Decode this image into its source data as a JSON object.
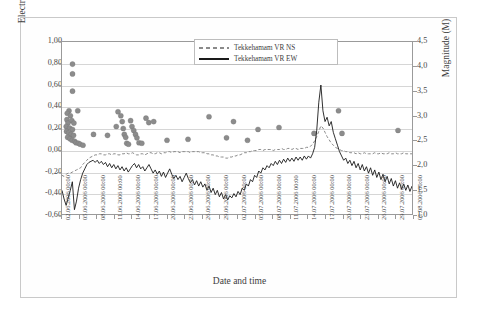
{
  "chart_data": {
    "type": "line",
    "title": "",
    "xlabel": "Date and time",
    "ylabel": "Electric potential (mV)",
    "y2label": "Magnitude (M)",
    "ylim": [
      -0.6,
      1.0
    ],
    "y2lim": [
      1.0,
      4.5
    ],
    "grid": true,
    "legend_position": "top-center",
    "y_ticks": [
      "-0,60",
      "-0,40",
      "-0,20",
      "0,00",
      "0,20",
      "0,40",
      "0,60",
      "0,80",
      "1,00"
    ],
    "y2_ticks": [
      "1,0",
      "1,5",
      "2,0",
      "2,5",
      "3,0",
      "3,5",
      "4,0",
      "4,5"
    ],
    "x_ticks": [
      "02.06.2006 00:00",
      "05.06.2006 00:00",
      "08.06.2006 00:00",
      "11.06.2006 00:00",
      "14.06.2006 00:00",
      "17.06.2006 00:00",
      "20.06.2006 00:00",
      "23.06.2006 00:00",
      "26.06.2006 00:00",
      "29.06.2006 00:00",
      "02.07.2006 00:00",
      "05.07.2006 00:00",
      "08.07.2006 00:00",
      "11.07.2006 00:00",
      "14.07.2006 00:00",
      "17.07.2006 00:00",
      "20.07.2006 00:00",
      "23.07.2006 00:00",
      "26.07.2006 00:00",
      "29.07.2006 00:00",
      "01.08.2006 00:00"
    ],
    "series": [
      {
        "name": "Tekkehamam VR NS",
        "style": "dashed",
        "color": "#8a8a8a",
        "axis": "left",
        "values": [
          -0.24,
          -0.25,
          -0.23,
          -0.22,
          -0.22,
          -0.21,
          -0.2,
          -0.19,
          -0.18,
          -0.17,
          -0.14,
          -0.12,
          -0.1,
          -0.08,
          -0.07,
          -0.06,
          -0.05,
          -0.05,
          -0.04,
          -0.04,
          -0.05,
          -0.05,
          -0.04,
          -0.04,
          -0.05,
          -0.04,
          -0.04,
          -0.05,
          -0.05,
          -0.04,
          -0.04,
          -0.03,
          -0.04,
          -0.04,
          -0.03,
          -0.04,
          -0.05,
          -0.05,
          -0.04,
          -0.04,
          -0.05,
          -0.04,
          -0.03,
          -0.03,
          -0.04,
          -0.04,
          -0.03,
          -0.03,
          -0.04,
          -0.03,
          -0.03,
          -0.02,
          -0.02,
          -0.03,
          -0.02,
          -0.02,
          -0.02,
          -0.03,
          -0.02,
          -0.02,
          -0.02,
          -0.02,
          -0.03,
          -0.02,
          -0.02,
          -0.02,
          -0.02,
          -0.03,
          -0.03,
          -0.03,
          -0.04,
          -0.04,
          -0.05,
          -0.05,
          -0.06,
          -0.06,
          -0.07,
          -0.07,
          -0.07,
          -0.08,
          -0.08,
          -0.07,
          -0.07,
          -0.06,
          -0.06,
          -0.05,
          -0.05,
          -0.04,
          -0.03,
          -0.03,
          -0.02,
          -0.02,
          -0.01,
          -0.01,
          -0.01,
          0.0,
          0.0,
          -0.01,
          0.0,
          0.0,
          0.0,
          0.0,
          -0.01,
          0.0,
          0.0,
          0.0,
          0.01,
          0.0,
          0.0,
          0.01,
          0.01,
          0.0,
          0.01,
          0.01,
          0.0,
          0.01,
          0.01,
          0.01,
          0.02,
          0.02,
          0.03,
          0.05,
          0.08,
          0.12,
          0.17,
          0.22,
          0.2,
          0.16,
          0.12,
          0.09,
          0.06,
          0.04,
          0.02,
          0.01,
          0.0,
          -0.01,
          -0.01,
          -0.02,
          -0.02,
          -0.03,
          -0.03,
          -0.03,
          -0.04,
          -0.03,
          -0.04,
          -0.04,
          -0.03,
          -0.04,
          -0.04,
          -0.04,
          -0.04,
          -0.03,
          -0.04,
          -0.04,
          -0.03,
          -0.04,
          -0.04,
          -0.04,
          -0.03,
          -0.04,
          -0.04,
          -0.03,
          -0.04,
          -0.04,
          -0.04,
          -0.03,
          -0.04,
          -0.04,
          -0.04,
          -0.04
        ]
      },
      {
        "name": "Tekkehamam VR EW",
        "style": "solid",
        "color": "#1a1a1a",
        "axis": "left",
        "values": [
          -0.38,
          -0.46,
          -0.52,
          -0.45,
          -0.38,
          -0.3,
          -0.56,
          -0.48,
          -0.36,
          -0.28,
          -0.22,
          -0.18,
          -0.14,
          -0.12,
          -0.11,
          -0.1,
          -0.12,
          -0.1,
          -0.13,
          -0.11,
          -0.14,
          -0.12,
          -0.16,
          -0.13,
          -0.17,
          -0.14,
          -0.18,
          -0.15,
          -0.19,
          -0.16,
          -0.2,
          -0.17,
          -0.21,
          -0.18,
          -0.15,
          -0.13,
          -0.17,
          -0.14,
          -0.18,
          -0.16,
          -0.2,
          -0.17,
          -0.14,
          -0.18,
          -0.22,
          -0.19,
          -0.23,
          -0.2,
          -0.25,
          -0.21,
          -0.26,
          -0.22,
          -0.18,
          -0.23,
          -0.27,
          -0.24,
          -0.28,
          -0.25,
          -0.3,
          -0.26,
          -0.22,
          -0.27,
          -0.31,
          -0.28,
          -0.33,
          -0.29,
          -0.34,
          -0.3,
          -0.35,
          -0.32,
          -0.38,
          -0.34,
          -0.4,
          -0.36,
          -0.42,
          -0.38,
          -0.44,
          -0.4,
          -0.46,
          -0.42,
          -0.47,
          -0.43,
          -0.45,
          -0.41,
          -0.44,
          -0.39,
          -0.42,
          -0.36,
          -0.38,
          -0.32,
          -0.34,
          -0.28,
          -0.3,
          -0.24,
          -0.26,
          -0.2,
          -0.22,
          -0.17,
          -0.19,
          -0.15,
          -0.17,
          -0.13,
          -0.15,
          -0.11,
          -0.14,
          -0.1,
          -0.13,
          -0.09,
          -0.12,
          -0.08,
          -0.11,
          -0.08,
          -0.11,
          -0.07,
          -0.1,
          -0.07,
          -0.1,
          -0.06,
          -0.09,
          -0.06,
          -0.08,
          -0.04,
          0.02,
          0.18,
          0.44,
          0.6,
          0.36,
          0.26,
          0.3,
          0.22,
          0.26,
          0.16,
          0.1,
          0.04,
          -0.02,
          -0.06,
          -0.1,
          -0.08,
          -0.13,
          -0.1,
          -0.15,
          -0.11,
          -0.17,
          -0.13,
          -0.19,
          -0.14,
          -0.2,
          -0.16,
          -0.22,
          -0.17,
          -0.24,
          -0.19,
          -0.26,
          -0.21,
          -0.28,
          -0.23,
          -0.3,
          -0.25,
          -0.32,
          -0.27,
          -0.34,
          -0.29,
          -0.36,
          -0.31,
          -0.37,
          -0.32,
          -0.38,
          -0.33,
          -0.39,
          -0.34
        ]
      },
      {
        "name": "Earthquake magnitudes",
        "style": "scatter",
        "color": "#8c8c8c",
        "axis": "right",
        "points": [
          {
            "x": 0.03,
            "m": 4.05
          },
          {
            "x": 0.03,
            "m": 3.85
          },
          {
            "x": 0.03,
            "m": 3.5
          },
          {
            "x": 0.02,
            "m": 3.1
          },
          {
            "x": 0.015,
            "m": 3.05
          },
          {
            "x": 0.024,
            "m": 3.0
          },
          {
            "x": 0.045,
            "m": 3.1
          },
          {
            "x": 0.014,
            "m": 2.92
          },
          {
            "x": 0.028,
            "m": 2.9
          },
          {
            "x": 0.017,
            "m": 2.85
          },
          {
            "x": 0.034,
            "m": 2.85
          },
          {
            "x": 0.012,
            "m": 2.78
          },
          {
            "x": 0.022,
            "m": 2.75
          },
          {
            "x": 0.03,
            "m": 2.72
          },
          {
            "x": 0.013,
            "m": 2.68
          },
          {
            "x": 0.019,
            "m": 2.65
          },
          {
            "x": 0.026,
            "m": 2.62
          },
          {
            "x": 0.033,
            "m": 2.6
          },
          {
            "x": 0.016,
            "m": 2.56
          },
          {
            "x": 0.023,
            "m": 2.53
          },
          {
            "x": 0.029,
            "m": 2.5
          },
          {
            "x": 0.036,
            "m": 2.48
          },
          {
            "x": 0.04,
            "m": 2.45
          },
          {
            "x": 0.047,
            "m": 2.44
          },
          {
            "x": 0.052,
            "m": 2.42
          },
          {
            "x": 0.06,
            "m": 2.4
          },
          {
            "x": 0.09,
            "m": 2.62
          },
          {
            "x": 0.13,
            "m": 2.6
          },
          {
            "x": 0.155,
            "m": 2.78
          },
          {
            "x": 0.16,
            "m": 3.08
          },
          {
            "x": 0.168,
            "m": 3.0
          },
          {
            "x": 0.172,
            "m": 2.88
          },
          {
            "x": 0.175,
            "m": 2.74
          },
          {
            "x": 0.178,
            "m": 2.62
          },
          {
            "x": 0.182,
            "m": 2.56
          },
          {
            "x": 0.185,
            "m": 2.44
          },
          {
            "x": 0.19,
            "m": 2.42
          },
          {
            "x": 0.196,
            "m": 2.9
          },
          {
            "x": 0.2,
            "m": 2.78
          },
          {
            "x": 0.205,
            "m": 2.7
          },
          {
            "x": 0.21,
            "m": 2.62
          },
          {
            "x": 0.214,
            "m": 2.55
          },
          {
            "x": 0.22,
            "m": 2.45
          },
          {
            "x": 0.228,
            "m": 2.44
          },
          {
            "x": 0.24,
            "m": 2.95
          },
          {
            "x": 0.248,
            "m": 2.86
          },
          {
            "x": 0.262,
            "m": 2.88
          },
          {
            "x": 0.3,
            "m": 2.5
          },
          {
            "x": 0.36,
            "m": 2.52
          },
          {
            "x": 0.42,
            "m": 2.98
          },
          {
            "x": 0.47,
            "m": 2.55
          },
          {
            "x": 0.49,
            "m": 2.88
          },
          {
            "x": 0.53,
            "m": 2.5
          },
          {
            "x": 0.56,
            "m": 2.72
          },
          {
            "x": 0.62,
            "m": 2.76
          },
          {
            "x": 0.72,
            "m": 2.64
          },
          {
            "x": 0.79,
            "m": 3.1
          },
          {
            "x": 0.8,
            "m": 2.64
          },
          {
            "x": 0.96,
            "m": 2.7
          }
        ]
      }
    ]
  },
  "legend": {
    "items": [
      {
        "label": "Tekkehamam VR NS"
      },
      {
        "label": "Tekkehamam VR EW"
      }
    ]
  }
}
